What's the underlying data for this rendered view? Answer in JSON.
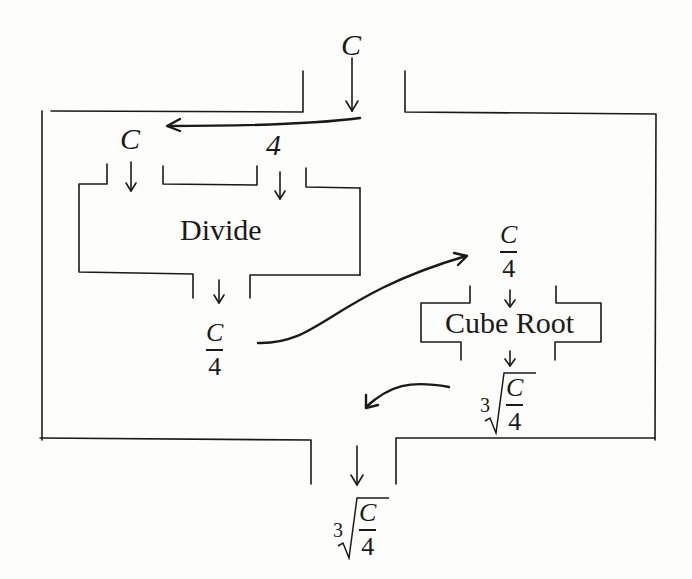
{
  "diagram": {
    "title": "",
    "outer_machine": {
      "input": "C",
      "output_index": "3",
      "output_numerator": "C",
      "output_denominator": "4"
    },
    "divide_box": {
      "label": "Divide",
      "inputs": [
        "C",
        "4"
      ],
      "output_numerator": "C",
      "output_denominator": "4"
    },
    "cube_root_box": {
      "label": "Cube Root",
      "input_numerator": "C",
      "input_denominator": "4",
      "output_index": "3",
      "output_numerator": "C",
      "output_denominator": "4"
    },
    "colors": {
      "line": "#1a1a1a",
      "background": "#fdfdfc"
    }
  }
}
